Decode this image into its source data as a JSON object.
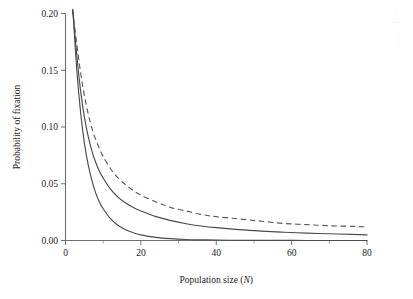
{
  "figure": {
    "background": "#ffffff",
    "axis_color": "#6f6f6f",
    "curve_color": "#4a4a4a"
  },
  "chart_data": {
    "type": "line",
    "title": "",
    "subtitle": "",
    "xlabel_text": "Population size (",
    "xlabel_italic": "N",
    "xlabel_tail": ")",
    "xlabel": "Population size (N)",
    "ylabel": "Probability of fixation",
    "xlim": [
      0,
      80
    ],
    "ylim": [
      0.0,
      0.2
    ],
    "grid": false,
    "legend": "none",
    "xticks": [
      0,
      20,
      40,
      60,
      80
    ],
    "xticklabels": [
      "0",
      "20",
      "40",
      "60",
      "80"
    ],
    "xticks_minor": [
      10,
      30,
      50,
      70
    ],
    "yticks": [
      0.0,
      0.05,
      0.1,
      0.15,
      0.2
    ],
    "yticklabels": [
      "0.00",
      "0.05",
      "0.10",
      "0.15",
      "0.20"
    ],
    "x": [
      2,
      3,
      4,
      5,
      6,
      7,
      8,
      9,
      10,
      12,
      14,
      16,
      18,
      20,
      24,
      28,
      32,
      36,
      40,
      46,
      52,
      58,
      64,
      70,
      76,
      80
    ],
    "series": [
      {
        "name": "upper-dashed-curve",
        "style": "dashed",
        "values": [
          0.2,
          0.173,
          0.148,
          0.128,
          0.112,
          0.099,
          0.089,
          0.081,
          0.074,
          0.063,
          0.055,
          0.049,
          0.044,
          0.04,
          0.034,
          0.029,
          0.026,
          0.023,
          0.021,
          0.019,
          0.017,
          0.015,
          0.014,
          0.013,
          0.0125,
          0.012
        ]
      },
      {
        "name": "middle-solid-curve",
        "style": "solid",
        "values": [
          0.2,
          0.163,
          0.132,
          0.109,
          0.092,
          0.079,
          0.069,
          0.061,
          0.055,
          0.045,
          0.038,
          0.033,
          0.029,
          0.026,
          0.021,
          0.0175,
          0.0148,
          0.0128,
          0.0113,
          0.0096,
          0.0083,
          0.0073,
          0.0065,
          0.0059,
          0.0054,
          0.005
        ]
      },
      {
        "name": "lower-solid-curve",
        "style": "solid",
        "values": [
          0.2,
          0.15,
          0.113,
          0.086,
          0.067,
          0.053,
          0.042,
          0.034,
          0.028,
          0.019,
          0.0132,
          0.0094,
          0.0068,
          0.005,
          0.0028,
          0.0016,
          0.0009,
          0.0006,
          0.0004,
          0.0002,
          0.0001,
          0.0001,
          0.0,
          0.0,
          0.0,
          0.0
        ]
      }
    ]
  }
}
